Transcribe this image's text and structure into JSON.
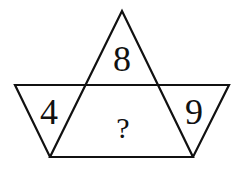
{
  "diagram": {
    "stroke_color": "#111111",
    "background": "#ffffff",
    "shapes": {
      "triangle": {
        "points": [
          [
            122,
            11
          ],
          [
            50,
            157
          ],
          [
            193,
            157
          ]
        ]
      },
      "trapezoid": {
        "points": [
          [
            15,
            85
          ],
          [
            229,
            85
          ],
          [
            193,
            157
          ],
          [
            50,
            157
          ]
        ]
      }
    },
    "regions": {
      "top": {
        "label": "8",
        "x": 122,
        "y": 70
      },
      "left": {
        "label": "4",
        "x": 50,
        "y": 123
      },
      "right": {
        "label": "9",
        "x": 194,
        "y": 123
      },
      "center": {
        "label": "?",
        "x": 123,
        "y": 137
      }
    }
  }
}
